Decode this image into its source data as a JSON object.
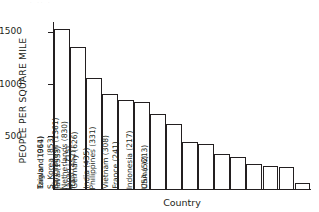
{
  "chart_data": {
    "type": "bar",
    "title": "",
    "xlabel": "Country",
    "ylabel": "PEOPLE PER SQUARE MILE",
    "ylim": [
      0,
      1600
    ],
    "yticks": [
      500,
      1000,
      1500
    ],
    "ytick_labels": [
      "500",
      "1000",
      "1500"
    ],
    "grid": false,
    "legend": null,
    "orientation": "vertical",
    "bar_style": {
      "fill": "#ffffff",
      "outline": "#231f20"
    },
    "categories": [
      "Java",
      "Bangladesh",
      "Taiwan",
      "England",
      "S. Korea",
      "Netherlands",
      "Japan",
      "Germany",
      "Italy",
      "India",
      "Philippines",
      "Vietnam",
      "France",
      "Indonesia",
      "China",
      "USA"
    ],
    "values": [
      1533,
      1361,
      1064,
      911,
      853,
      830,
      715,
      626,
      452,
      435,
      331,
      308,
      241,
      217,
      213,
      56
    ],
    "point_labels": [
      "Java (1533)",
      "Bangladesh (1361)",
      "Taiwan (1064)",
      "England (911)",
      "S. Korea (853)",
      "Netherlands (830)",
      "Japan (715)",
      "Germany (626)",
      "Italy (452)",
      "India (435)",
      "Philippines (331)",
      "Vietnam (308)",
      "France (241)",
      "Indonesia (217)",
      "China (213)",
      "USA (56)"
    ]
  },
  "artifact": {
    "top_fragment": "· ·· ·"
  }
}
